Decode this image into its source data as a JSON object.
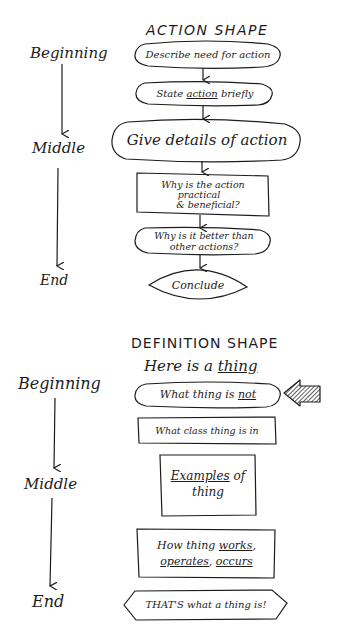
{
  "action_shape": {
    "title": "ACTION SHAPE",
    "stages": {
      "beginning": "Beginning",
      "middle": "Middle",
      "end": "End"
    },
    "nodes": [
      {
        "shape": "oval",
        "text": "Describe need for action"
      },
      {
        "shape": "oval",
        "text_pre": "State ",
        "text_underlined": "action",
        "text_post": " briefly"
      },
      {
        "shape": "oval-large",
        "text": "Give details of action"
      },
      {
        "shape": "rectangle",
        "line1": "Why is the action",
        "line2": "practical",
        "line3": "& beneficial?"
      },
      {
        "shape": "oval",
        "line1": "Why is it better than",
        "line2": "other actions?"
      },
      {
        "shape": "lens",
        "text": "Conclude"
      }
    ]
  },
  "definition_shape": {
    "title": "DEFINITION SHAPE",
    "subtitle_pre": "Here is a ",
    "subtitle_underlined": "thing",
    "stages": {
      "beginning": "Beginning",
      "middle": "Middle",
      "end": "End"
    },
    "nodes": [
      {
        "shape": "oval",
        "text_pre": "What thing is ",
        "text_underlined": "not",
        "marker": "hatched-arrow-left"
      },
      {
        "shape": "rectangle",
        "text": "What class thing is in"
      },
      {
        "shape": "rectangle",
        "line1_underlined": "Examples",
        "line1_post": " of",
        "line2": "thing"
      },
      {
        "shape": "rectangle",
        "line1_pre": "How thing ",
        "line1_underlined": "works",
        "line1_post": ",",
        "line2_underlined1": "operates",
        "line2_mid": ", ",
        "line2_underlined2": "occurs"
      },
      {
        "shape": "hexagon",
        "text": "THAT'S what a thing is!"
      }
    ]
  },
  "colors": {
    "ink": "#1c1c1c",
    "paper": "#ffffff"
  }
}
